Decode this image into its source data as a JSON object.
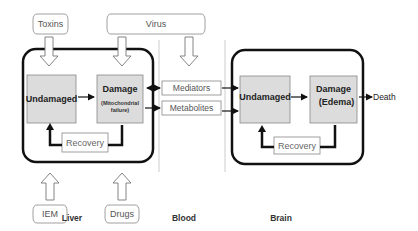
{
  "diagram": {
    "type": "flow-diagram",
    "inputs": {
      "toxins": "Toxins",
      "virus": "Virus",
      "iem": "IEM",
      "drugs": "Drugs"
    },
    "liver": {
      "label": "Liver",
      "undamaged": "Undamaged",
      "damage": "Damage",
      "damage_sub_1": "(Mitochondrial",
      "damage_sub_2": "failure)",
      "recovery": "Recovery"
    },
    "blood": {
      "label": "Blood",
      "mediators": "Mediators",
      "metabolites": "Metabolites"
    },
    "brain": {
      "label": "Brain",
      "undamaged": "Undamaged",
      "damage": "Damage",
      "damage_sub": "(Edema)",
      "recovery": "Recovery"
    },
    "outcome": "Death",
    "colors": {
      "state_fill": "#dcdcdc",
      "container_border": "#111111",
      "box_border": "#777777"
    }
  }
}
